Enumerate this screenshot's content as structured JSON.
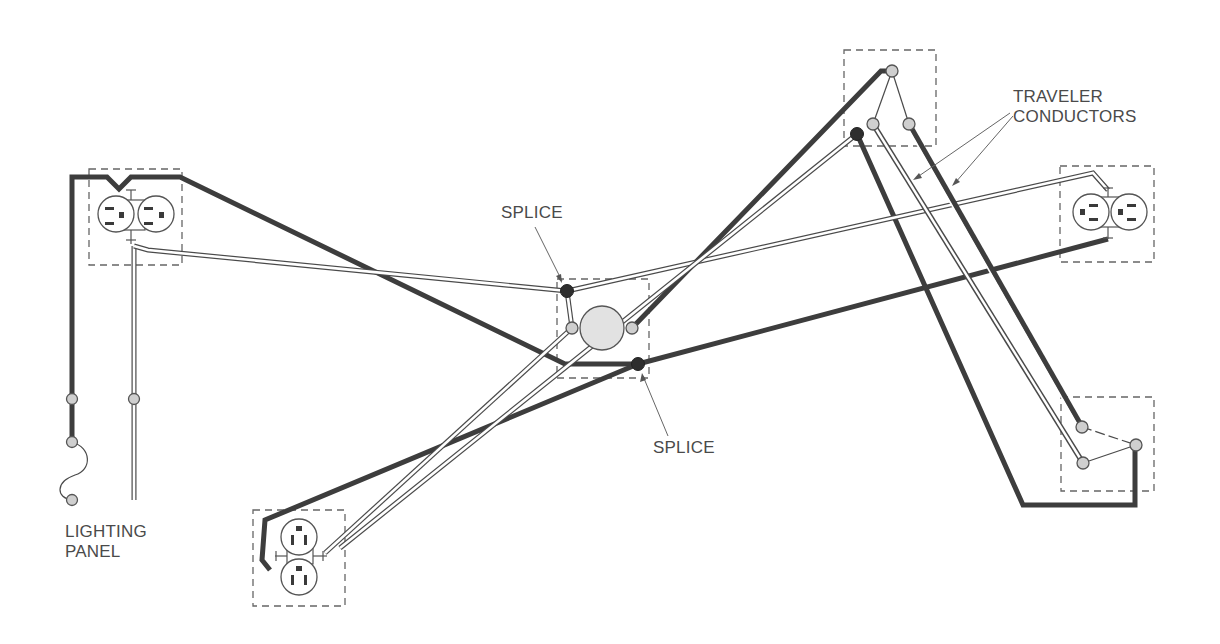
{
  "diagram": {
    "labels": {
      "lighting_panel": "LIGHTING\nPANEL",
      "splice_top": "SPLICE",
      "splice_bottom": "SPLICE",
      "traveler_conductors": "TRAVELER\nCONDUCTORS"
    },
    "components": [
      {
        "id": "lighting-panel",
        "type": "source"
      },
      {
        "id": "duplex-receptacle-left",
        "type": "duplex-receptacle"
      },
      {
        "id": "duplex-receptacle-right",
        "type": "duplex-receptacle"
      },
      {
        "id": "duplex-receptacle-bottom",
        "type": "duplex-receptacle"
      },
      {
        "id": "lighting-outlet-center",
        "type": "light-fixture"
      },
      {
        "id": "three-way-switch-top",
        "type": "three-way-switch"
      },
      {
        "id": "three-way-switch-bottom-right",
        "type": "three-way-switch"
      }
    ],
    "conductor_legend": {
      "hot": "solid black",
      "neutral": "white (double-line)",
      "travelers": "double-line between switches"
    },
    "colors": {
      "hot": "#3d3d3d",
      "neutral_outline": "#4a4a4a",
      "terminal_fill": "#cfcfcf",
      "splice_fill": "#2e2e2e",
      "fixture_fill": "#e2e2e2",
      "text": "#4a4a4a"
    }
  }
}
